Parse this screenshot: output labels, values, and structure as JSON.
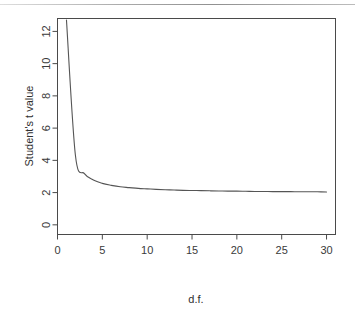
{
  "figure": {
    "background_color": "#ffffff",
    "axis_color": "#4a4a4a",
    "curve_color": "#555555",
    "scan_artifact": "horizontal-scan-line-top"
  },
  "chart_data": {
    "type": "line",
    "title": "",
    "subtitle": "",
    "xlabel": "d.f.",
    "ylabel": "Student's t value",
    "xlim": [
      0,
      31
    ],
    "ylim": [
      -0.6,
      12.8
    ],
    "grid": false,
    "legend": null,
    "legend_position": "none",
    "xticks": [
      0,
      5,
      10,
      15,
      20,
      25,
      30
    ],
    "xtick_labels": [
      "0",
      "5",
      "10",
      "15",
      "20",
      "25",
      "30"
    ],
    "yticks": [
      0,
      2,
      4,
      6,
      8,
      10,
      12
    ],
    "ytick_labels": [
      "0",
      "2",
      "4",
      "6",
      "8",
      "10",
      "12"
    ],
    "series": [
      {
        "name": "Student's t critical value (two-sided 95%)",
        "x": [
          1,
          2,
          3,
          4,
          5,
          6,
          7,
          8,
          9,
          10,
          11,
          12,
          13,
          14,
          15,
          16,
          17,
          18,
          19,
          20,
          21,
          22,
          23,
          24,
          25,
          26,
          27,
          28,
          29,
          30
        ],
        "values": [
          12.71,
          4.3,
          3.18,
          2.78,
          2.57,
          2.45,
          2.36,
          2.31,
          2.26,
          2.23,
          2.2,
          2.18,
          2.16,
          2.14,
          2.13,
          2.12,
          2.11,
          2.1,
          2.09,
          2.09,
          2.08,
          2.07,
          2.07,
          2.06,
          2.06,
          2.06,
          2.05,
          2.05,
          2.05,
          2.04
        ]
      }
    ],
    "annotations": []
  },
  "axis_titles": {
    "x": "d.f.",
    "y": "Student's t value"
  }
}
